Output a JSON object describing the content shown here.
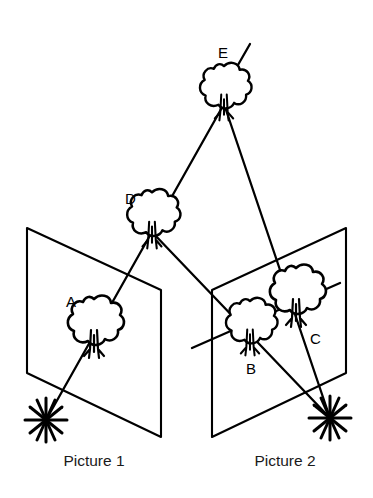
{
  "figure": {
    "background_color": "#ffffff",
    "ink_color": "#000000",
    "width": 373,
    "height": 498
  },
  "captions": [
    {
      "id": "picture-1",
      "text": "Picture 1",
      "x": 94,
      "y": 466
    },
    {
      "id": "picture-2",
      "text": "Picture 2",
      "x": 285,
      "y": 466
    }
  ],
  "point_labels": [
    {
      "id": "A",
      "text": "A",
      "x": 66,
      "y": 307
    },
    {
      "id": "B",
      "text": "B",
      "x": 246,
      "y": 374
    },
    {
      "id": "C",
      "text": "C",
      "x": 310,
      "y": 344
    },
    {
      "id": "D",
      "text": "D",
      "x": 125,
      "y": 204
    },
    {
      "id": "E",
      "text": "E",
      "x": 218,
      "y": 58
    }
  ],
  "trees": [
    {
      "id": "tree-a",
      "label": "A",
      "x": 94,
      "y": 325,
      "scale": 1.0
    },
    {
      "id": "tree-b",
      "label": "B",
      "x": 250,
      "y": 325,
      "scale": 0.92
    },
    {
      "id": "tree-c",
      "label": "C",
      "x": 296,
      "y": 294,
      "scale": 1.0
    },
    {
      "id": "tree-d",
      "label": "D",
      "x": 152,
      "y": 217,
      "scale": 0.95
    },
    {
      "id": "tree-e",
      "label": "E",
      "x": 224,
      "y": 90,
      "scale": 0.92
    }
  ],
  "stations": [
    {
      "id": "station-1",
      "label": "Picture 1 station",
      "x": 46,
      "y": 420
    },
    {
      "id": "station-2",
      "label": "Picture 2 station",
      "x": 330,
      "y": 418
    }
  ],
  "planes": [
    {
      "id": "picture-plane-1",
      "label": "Picture 1",
      "points": "27,228 161,290 161,437 27,373"
    },
    {
      "id": "picture-plane-2",
      "label": "Picture 2",
      "points": "212,290 346,228 346,373 212,437"
    }
  ],
  "sight_lines": [
    {
      "id": "ray-station1-to-d",
      "from": "station-1",
      "through": "tree-a",
      "to": "tree-d",
      "path": "M 46,420 L 152,232"
    },
    {
      "id": "ray-station1-to-e",
      "from": "station-1",
      "through": "tree-a",
      "to": "tree-e",
      "path": "M 152,232 L 224,104"
    },
    {
      "id": "ray-station2-to-d",
      "from": "station-2",
      "through": "tree-b",
      "to": "tree-d",
      "path": "M 330,418 L 152,232"
    },
    {
      "id": "ray-station2-to-e",
      "from": "station-2",
      "through": "tree-c",
      "to": "tree-e",
      "path": "M 330,418 L 224,104"
    }
  ],
  "terrain_lines": [
    {
      "id": "terrain-top",
      "path": "M 215,105 L 250,44"
    },
    {
      "id": "terrain-right",
      "path": "M 192,348 L 340,283"
    }
  ]
}
